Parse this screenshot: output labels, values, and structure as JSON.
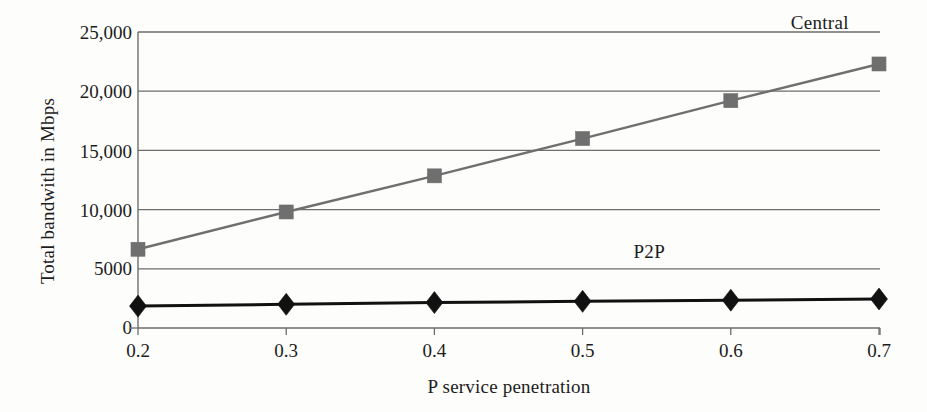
{
  "chart_data": {
    "type": "line",
    "title": "",
    "xlabel": "P service penetration",
    "ylabel": "Total bandwith in Mbps",
    "x": [
      0.2,
      0.3,
      0.4,
      0.5,
      0.6,
      0.7
    ],
    "categories": [
      "0.2",
      "0.3",
      "0.4",
      "0.5",
      "0.6",
      "0.7"
    ],
    "xtick_labels": [
      "0.2",
      "0.3",
      "0.4",
      "0.5",
      "0.6",
      "0.7"
    ],
    "ytick_labels": [
      "0",
      "5000",
      "10,000",
      "15,000",
      "20,000",
      "25,000"
    ],
    "ytick_values": [
      0,
      5000,
      10000,
      15000,
      20000,
      25000
    ],
    "ylim": [
      0,
      25000
    ],
    "xlim": [
      0.2,
      0.7
    ],
    "grid": "horizontal",
    "legend_position": "inline-annotation",
    "series": [
      {
        "name": "Central",
        "label": "Central",
        "marker": "square",
        "color": "#6f6f6f",
        "values": [
          6650,
          9800,
          12850,
          16000,
          19200,
          22300
        ],
        "annotation_x": 0.66,
        "annotation_y": 25800
      },
      {
        "name": "P2P",
        "label": "P2P",
        "marker": "diamond",
        "color": "#111111",
        "values": [
          1850,
          2000,
          2150,
          2250,
          2350,
          2450
        ],
        "annotation_x": 0.545,
        "annotation_y": 6400
      }
    ]
  },
  "colors": {
    "background": "#fdfdfb",
    "axis": "#6d6d6d",
    "grid": "#6d6d6d",
    "text": "#1c1c1c",
    "central": "#6f6f6f",
    "p2p": "#111111"
  }
}
